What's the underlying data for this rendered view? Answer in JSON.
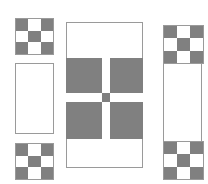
{
  "figure": {
    "background_color": "#ffffff",
    "fill_color": "#808080",
    "empty_color": "#ffffff",
    "outline_color": "#9a9a9a",
    "canvas": {
      "width": 208,
      "height": 184
    }
  },
  "blocks": [
    {
      "id": "top-left-checker",
      "type": "checkerboard",
      "label": "Nine-patch checkerboard block",
      "x": 15,
      "y": 18,
      "width": 39,
      "height": 37,
      "rows": 3,
      "cols": 3,
      "cells": [
        "g",
        "w",
        "g",
        "w",
        "g",
        "w",
        "g",
        "w",
        "g"
      ]
    },
    {
      "id": "left-middle-plain",
      "type": "plain",
      "label": "Plain rectangle block",
      "x": 15,
      "y": 63,
      "width": 39,
      "height": 71
    },
    {
      "id": "bottom-left-checker",
      "type": "checkerboard",
      "label": "Nine-patch checkerboard block",
      "x": 15,
      "y": 143,
      "width": 39,
      "height": 37,
      "rows": 3,
      "cols": 3,
      "cells": [
        "g",
        "w",
        "g",
        "w",
        "g",
        "w",
        "g",
        "w",
        "g"
      ]
    },
    {
      "id": "center-cross",
      "type": "cross",
      "label": "Central cross motif block",
      "x": 66,
      "y": 22,
      "width": 77,
      "height": 146,
      "inner_x": 0,
      "inner_y": 36,
      "inner_width": 77,
      "inner_height": 81,
      "rows": 3,
      "cols": 3,
      "col_fractions": [
        0.468,
        0.104,
        0.428
      ],
      "row_fractions": [
        0.432,
        0.111,
        0.457
      ],
      "cells": [
        "g",
        "w",
        "g",
        "w",
        "g",
        "w",
        "g",
        "w",
        "g"
      ]
    },
    {
      "id": "right-tall-strip",
      "type": "strip",
      "label": "Tall sashing strip with checkerboard corners",
      "x": 163,
      "y": 25,
      "width": 39,
      "height": 153,
      "top_checker": {
        "offset": 0,
        "height": 37,
        "rows": 3,
        "cols": 3,
        "cells": [
          "g",
          "w",
          "g",
          "w",
          "g",
          "w",
          "g",
          "w",
          "g"
        ]
      },
      "bottom_checker": {
        "offset": 116,
        "height": 37,
        "rows": 3,
        "cols": 3,
        "cells": [
          "g",
          "w",
          "g",
          "w",
          "g",
          "w",
          "g",
          "w",
          "g"
        ]
      }
    }
  ]
}
